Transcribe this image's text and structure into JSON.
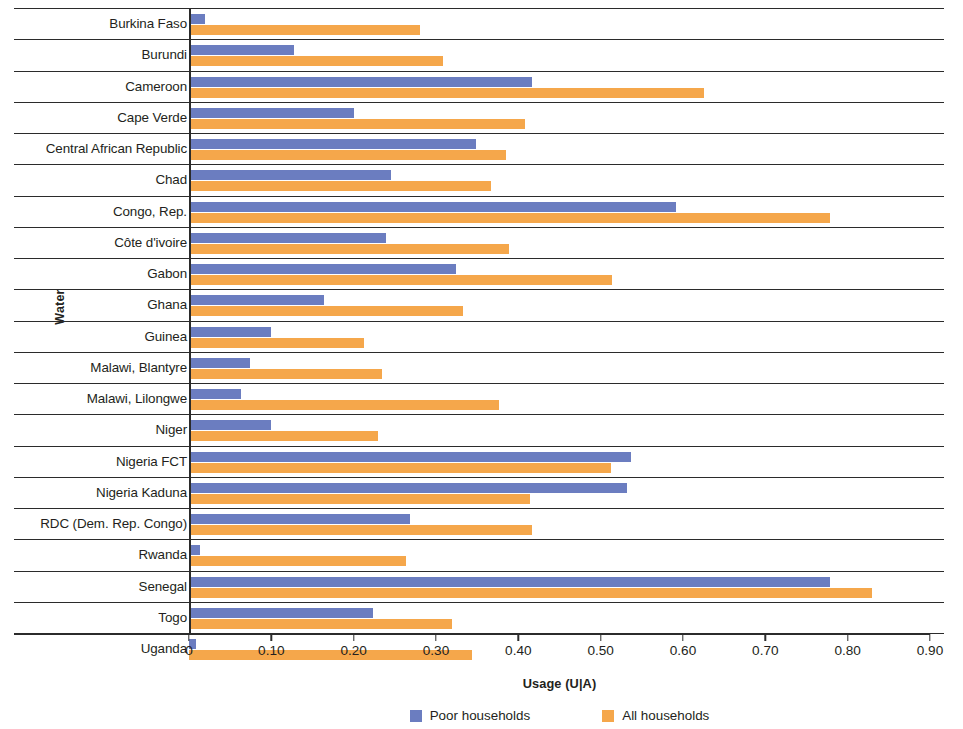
{
  "chart_data": {
    "type": "bar",
    "orientation": "horizontal",
    "title": "",
    "xlabel": "Usage (U|A)",
    "ylabel": "Water",
    "xlim": [
      0,
      0.9
    ],
    "xticks": [
      "0",
      "0.10",
      "0.20",
      "0.30",
      "0.40",
      "0.50",
      "0.60",
      "0.70",
      "0.80",
      "0.90"
    ],
    "xtick_values": [
      0,
      0.1,
      0.2,
      0.3,
      0.4,
      0.5,
      0.6,
      0.7,
      0.8,
      0.9
    ],
    "grid": false,
    "legend_position": "bottom-center",
    "categories": [
      "Burkina Faso",
      "Burundi",
      "Cameroon",
      "Cape Verde",
      "Central African Republic",
      "Chad",
      "Congo, Rep.",
      "Côte d'ivoire",
      "Gabon",
      "Ghana",
      "Guinea",
      "Malawi, Blantyre",
      "Malawi, Lilongwe",
      "Niger",
      "Nigeria  FCT",
      "Nigeria Kaduna",
      "RDC (Dem. Rep. Congo)",
      "Rwanda",
      "Senegal",
      "Togo",
      "Uganda"
    ],
    "series": [
      {
        "name": "Poor households",
        "color": "#6b7dc0",
        "values": [
          0.019,
          0.127,
          0.416,
          0.2,
          0.348,
          0.245,
          0.592,
          0.239,
          0.324,
          0.164,
          0.1,
          0.074,
          0.063,
          0.099,
          0.537,
          0.532,
          0.268,
          0.013,
          0.779,
          0.224,
          0.008
        ]
      },
      {
        "name": "All households",
        "color": "#f5a74b",
        "values": [
          0.281,
          0.308,
          0.625,
          0.408,
          0.385,
          0.367,
          0.779,
          0.389,
          0.514,
          0.333,
          0.213,
          0.234,
          0.376,
          0.229,
          0.513,
          0.414,
          0.417,
          0.263,
          0.83,
          0.32,
          0.344
        ]
      }
    ]
  },
  "legend": {
    "items": [
      {
        "label": "Poor households",
        "color": "#6b7dc0"
      },
      {
        "label": "All households",
        "color": "#f5a74b"
      }
    ]
  }
}
